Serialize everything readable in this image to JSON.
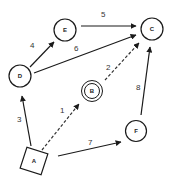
{
  "diagram": {
    "type": "directed-weighted-graph",
    "colors": {
      "stroke": "#1a1a1a",
      "background": "#ffffff",
      "text": "#222222"
    },
    "nodes": [
      {
        "id": "A",
        "label": "A",
        "shape": "square-rotated",
        "x": 34,
        "y": 161
      },
      {
        "id": "B",
        "label": "B",
        "shape": "double-circle",
        "x": 92,
        "y": 91
      },
      {
        "id": "C",
        "label": "C",
        "shape": "circle",
        "x": 152,
        "y": 29
      },
      {
        "id": "D",
        "label": "D",
        "shape": "circle",
        "x": 20,
        "y": 76
      },
      {
        "id": "E",
        "label": "E",
        "shape": "circle",
        "x": 65,
        "y": 30
      },
      {
        "id": "F",
        "label": "F",
        "shape": "circle",
        "x": 136,
        "y": 131
      }
    ],
    "edges": [
      {
        "from": "A",
        "to": "B",
        "weight": "1",
        "style": "dashed",
        "x1": 42,
        "y1": 150,
        "x2": 79,
        "y2": 104,
        "lx": 60,
        "ly": 113
      },
      {
        "from": "B",
        "to": "C",
        "weight": "2",
        "style": "dashed",
        "x1": 105,
        "y1": 80,
        "x2": 139,
        "y2": 43,
        "lx": 106,
        "ly": 70
      },
      {
        "from": "A",
        "to": "D",
        "weight": "3",
        "style": "solid",
        "x1": 31,
        "y1": 146,
        "x2": 22,
        "y2": 96,
        "lx": 17,
        "ly": 122
      },
      {
        "from": "D",
        "to": "E",
        "weight": "4",
        "style": "solid",
        "x1": 30,
        "y1": 67,
        "x2": 54,
        "y2": 42,
        "lx": 30,
        "ly": 48
      },
      {
        "from": "E",
        "to": "C",
        "weight": "5",
        "style": "solid",
        "x1": 81,
        "y1": 26,
        "x2": 136,
        "y2": 26,
        "lx": 101,
        "ly": 17
      },
      {
        "from": "D",
        "to": "C",
        "weight": "6",
        "style": "solid",
        "x1": 34,
        "y1": 73,
        "x2": 136,
        "y2": 35,
        "lx": 74,
        "ly": 51
      },
      {
        "from": "A",
        "to": "F",
        "weight": "7",
        "style": "solid",
        "x1": 58,
        "y1": 156,
        "x2": 121,
        "y2": 142,
        "lx": 88,
        "ly": 145
      },
      {
        "from": "F",
        "to": "C",
        "weight": "8",
        "style": "solid",
        "x1": 141,
        "y1": 115,
        "x2": 150,
        "y2": 47,
        "lx": 136,
        "ly": 90
      }
    ]
  }
}
